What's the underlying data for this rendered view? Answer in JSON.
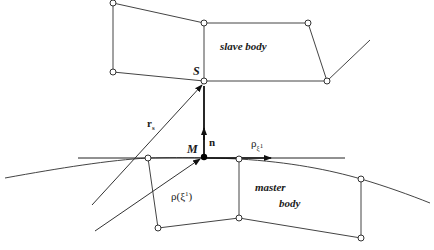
{
  "diagram": {
    "labels": {
      "slave_body": "slave body",
      "master_body_line1": "master",
      "master_body_line2": "body",
      "point_S": "S",
      "point_M": "M",
      "normal": "n",
      "r_main": "r",
      "r_sub": "s",
      "rho_arg_main": "ρ(ξ",
      "rho_arg_sup": "1",
      "rho_arg_close": ")",
      "rho_deriv_main": "ρ",
      "rho_deriv_sub": "ξ",
      "rho_deriv_sup": "1"
    },
    "colors": {
      "stroke": "#333333",
      "node_fill": "#ffffff",
      "point_fill": "#000000"
    }
  }
}
